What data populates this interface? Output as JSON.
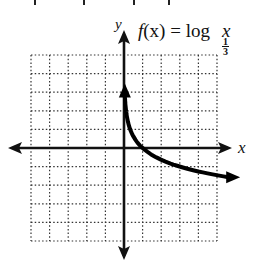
{
  "chart_data": {
    "type": "line",
    "function": "log base 1/3 of x",
    "xlabel": "x",
    "ylabel": "y",
    "xlim": [
      -5,
      5
    ],
    "ylim": [
      -5,
      5
    ],
    "grid": true,
    "grid_style": "dotted",
    "grid_step": 1,
    "legend": null,
    "series": [
      {
        "name": "f(x) = log_{1/3} x",
        "x": [
          0.04,
          0.111,
          0.2,
          0.333,
          0.5,
          1,
          2,
          3,
          4,
          5
        ],
        "y": [
          2.93,
          2.0,
          1.46,
          1.0,
          0.63,
          0.0,
          -0.63,
          -1.0,
          -1.26,
          -1.46
        ],
        "arrows": [
          "up",
          "right"
        ]
      }
    ]
  },
  "labels": {
    "title_prefix": "f",
    "title_paren": "(x) = log",
    "base_num": "1",
    "base_den": "3",
    "title_var": "x",
    "x_axis": "x",
    "y_axis": "y"
  }
}
